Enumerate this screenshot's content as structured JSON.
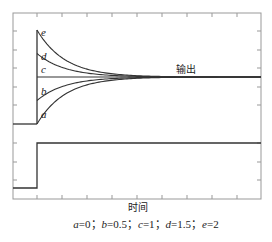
{
  "figure": {
    "output_label": "输出",
    "xlabel": "时间",
    "caption_items": [
      {
        "letter": "a",
        "value": "0"
      },
      {
        "letter": "b",
        "value": "0.5"
      },
      {
        "letter": "c",
        "value": "1"
      },
      {
        "letter": "d",
        "value": "1.5"
      },
      {
        "letter": "e",
        "value": "2"
      }
    ],
    "caption_text": "a=0; b=0.5; c=1; d=1.5; e=2",
    "line_color": "#333333",
    "axis_color": "#888888"
  },
  "chart_data": {
    "type": "line",
    "title": "",
    "xlabel": "时间",
    "ylabel": "",
    "x_ticks_count": 9,
    "grid": false,
    "legend": "curve labels a-e placed near curve start",
    "annotations": [
      "输出"
    ],
    "input": {
      "name": "input step",
      "x": [
        0,
        1,
        1,
        10
      ],
      "y": [
        0,
        0,
        1,
        1
      ]
    },
    "output": {
      "baseline": 0,
      "final_value": 1,
      "step_time": 1,
      "series": [
        {
          "name": "a",
          "param": 0,
          "initial": 0
        },
        {
          "name": "b",
          "param": 0.5,
          "initial": 0.5
        },
        {
          "name": "c",
          "param": 1,
          "initial": 1
        },
        {
          "name": "d",
          "param": 1.5,
          "initial": 1.5
        },
        {
          "name": "e",
          "param": 2,
          "initial": 2
        }
      ]
    }
  }
}
